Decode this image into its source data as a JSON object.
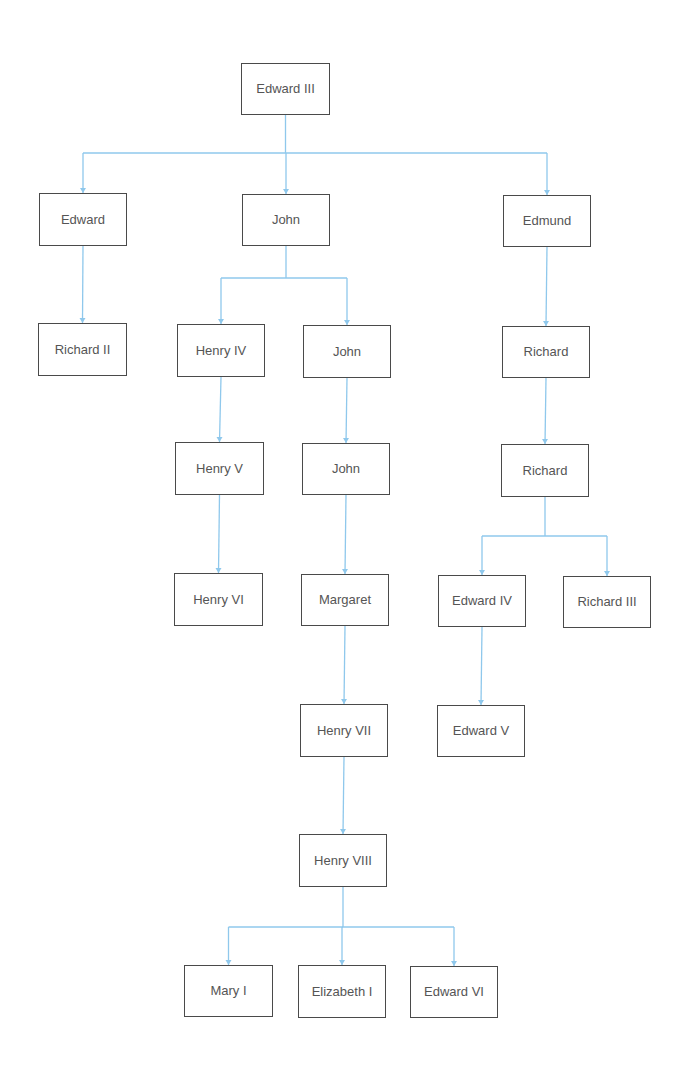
{
  "diagram": {
    "type": "family-tree",
    "colors": {
      "connector": "#8fc8ec",
      "box_border": "#4a4a4a",
      "text": "#555555",
      "background": "#ffffff"
    },
    "nodes": [
      {
        "id": "edward-iii",
        "label": "Edward III",
        "x": 241,
        "y": 63,
        "w": 89,
        "h": 52
      },
      {
        "id": "edward",
        "label": "Edward",
        "x": 39,
        "y": 193,
        "w": 88,
        "h": 53
      },
      {
        "id": "john-1",
        "label": "John",
        "x": 242,
        "y": 194,
        "w": 88,
        "h": 52
      },
      {
        "id": "edmund",
        "label": "Edmund",
        "x": 503,
        "y": 195,
        "w": 88,
        "h": 52
      },
      {
        "id": "richard-ii",
        "label": "Richard II",
        "x": 38,
        "y": 323,
        "w": 89,
        "h": 53
      },
      {
        "id": "henry-iv",
        "label": "Henry IV",
        "x": 177,
        "y": 324,
        "w": 88,
        "h": 53
      },
      {
        "id": "john-2",
        "label": "John",
        "x": 303,
        "y": 325,
        "w": 88,
        "h": 53
      },
      {
        "id": "richard-1",
        "label": "Richard",
        "x": 502,
        "y": 326,
        "w": 88,
        "h": 52
      },
      {
        "id": "henry-v",
        "label": "Henry V",
        "x": 175,
        "y": 442,
        "w": 89,
        "h": 53
      },
      {
        "id": "john-3",
        "label": "John",
        "x": 302,
        "y": 443,
        "w": 88,
        "h": 52
      },
      {
        "id": "richard-2",
        "label": "Richard",
        "x": 501,
        "y": 444,
        "w": 88,
        "h": 53
      },
      {
        "id": "henry-vi",
        "label": "Henry VI",
        "x": 174,
        "y": 573,
        "w": 89,
        "h": 53
      },
      {
        "id": "margaret",
        "label": "Margaret",
        "x": 301,
        "y": 574,
        "w": 88,
        "h": 52
      },
      {
        "id": "edward-iv",
        "label": "Edward IV",
        "x": 438,
        "y": 575,
        "w": 88,
        "h": 52
      },
      {
        "id": "richard-iii",
        "label": "Richard III",
        "x": 563,
        "y": 576,
        "w": 88,
        "h": 52
      },
      {
        "id": "henry-vii",
        "label": "Henry VII",
        "x": 300,
        "y": 704,
        "w": 88,
        "h": 53
      },
      {
        "id": "edward-v",
        "label": "Edward V",
        "x": 437,
        "y": 705,
        "w": 88,
        "h": 52
      },
      {
        "id": "henry-viii",
        "label": "Henry VIII",
        "x": 299,
        "y": 834,
        "w": 88,
        "h": 53
      },
      {
        "id": "mary-i",
        "label": "Mary I",
        "x": 184,
        "y": 965,
        "w": 89,
        "h": 52
      },
      {
        "id": "elizabeth-i",
        "label": "Elizabeth I",
        "x": 298,
        "y": 965,
        "w": 88,
        "h": 53
      },
      {
        "id": "edward-vi",
        "label": "Edward VI",
        "x": 410,
        "y": 966,
        "w": 88,
        "h": 52
      }
    ],
    "edges": [
      {
        "from": "edward-iii",
        "to": "edward"
      },
      {
        "from": "edward-iii",
        "to": "john-1"
      },
      {
        "from": "edward-iii",
        "to": "edmund"
      },
      {
        "from": "edward",
        "to": "richard-ii"
      },
      {
        "from": "john-1",
        "to": "henry-iv"
      },
      {
        "from": "john-1",
        "to": "john-2"
      },
      {
        "from": "edmund",
        "to": "richard-1"
      },
      {
        "from": "henry-iv",
        "to": "henry-v"
      },
      {
        "from": "john-2",
        "to": "john-3"
      },
      {
        "from": "richard-1",
        "to": "richard-2"
      },
      {
        "from": "henry-v",
        "to": "henry-vi"
      },
      {
        "from": "john-3",
        "to": "margaret"
      },
      {
        "from": "richard-2",
        "to": "edward-iv"
      },
      {
        "from": "richard-2",
        "to": "richard-iii"
      },
      {
        "from": "margaret",
        "to": "henry-vii"
      },
      {
        "from": "edward-iv",
        "to": "edward-v"
      },
      {
        "from": "henry-vii",
        "to": "henry-viii"
      },
      {
        "from": "henry-viii",
        "to": "mary-i"
      },
      {
        "from": "henry-viii",
        "to": "elizabeth-i"
      },
      {
        "from": "henry-viii",
        "to": "edward-vi"
      }
    ],
    "brackets": [
      {
        "parent": "edward-iii",
        "bar_y": 153
      },
      {
        "parent": "john-1",
        "bar_y": 278
      },
      {
        "parent": "richard-2",
        "bar_y": 536
      },
      {
        "parent": "henry-viii",
        "bar_y": 927
      }
    ]
  }
}
